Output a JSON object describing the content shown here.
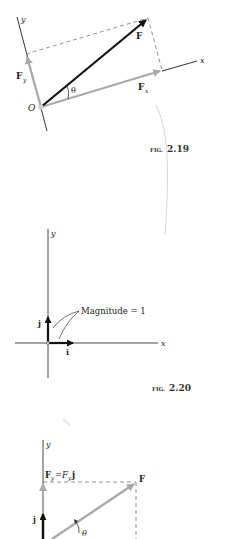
{
  "figures": [
    {
      "id": "fig_2_19",
      "caption": "FIG. 2.19",
      "caption_prefix": "FIG.",
      "caption_number": "2.19",
      "labels": {
        "y_axis": "y",
        "x_axis": "x",
        "origin": "O",
        "force": "F",
        "fy": "F",
        "fy_sub": "y",
        "fx": "F",
        "fx_sub": "x",
        "angle": "θ"
      }
    },
    {
      "id": "fig_2_20",
      "caption": "FIG. 2.20",
      "caption_prefix": "FIG.",
      "caption_number": "2.20",
      "labels": {
        "y_axis": "y",
        "x_axis": "x",
        "unit_j": "j",
        "unit_i": "i",
        "annotation": "Magnitude = 1"
      }
    },
    {
      "id": "fig_2_21_partial",
      "labels": {
        "y_axis": "y",
        "fy_eq_left": "F",
        "fy_eq_left_sub": "y",
        "fy_eq_mid": "=",
        "fy_eq_right": "F",
        "fy_eq_right_sub": "y",
        "fy_eq_unit": "j",
        "force": "F",
        "unit_j": "j",
        "angle": "θ"
      }
    }
  ],
  "colors": {
    "ink": "#111111",
    "component_gray": "#aaaaaa",
    "axis": "#333333",
    "dash": "#777777"
  }
}
